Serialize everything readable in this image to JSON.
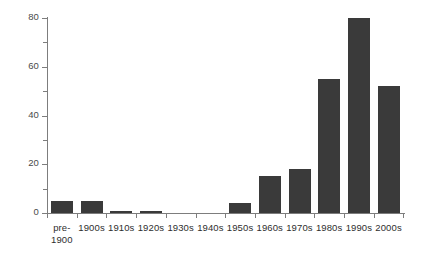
{
  "chart_data": {
    "type": "bar",
    "title": "",
    "subtitle": "",
    "xlabel": "",
    "ylabel": "",
    "categories": [
      "pre-\n1900",
      "1900s",
      "1910s",
      "1920s",
      "1930s",
      "1940s",
      "1950s",
      "1960s",
      "1970s",
      "1980s",
      "1990s",
      "2000s"
    ],
    "values": [
      5,
      5,
      1,
      1,
      0,
      0,
      4,
      15,
      18,
      55,
      80,
      52
    ],
    "ylim": [
      0,
      80
    ],
    "xlim": [
      0,
      12
    ],
    "y_major_ticks": [
      0,
      20,
      40,
      60,
      80
    ],
    "y_minor_ticks": [
      10,
      30,
      50,
      70
    ],
    "y_tick_labels": [
      "0",
      "20",
      "40",
      "60",
      "80"
    ],
    "grid": false,
    "legend": null,
    "legend_position": "none",
    "series": [
      {
        "name": "count",
        "values": [
          5,
          5,
          1,
          1,
          0,
          0,
          4,
          15,
          18,
          55,
          80,
          52
        ]
      }
    ],
    "colors": {
      "bar": "#3a3a3a",
      "axis": "#7d7d7d",
      "text": "#2e2e2e",
      "tick_label": "#4a4a4a",
      "background": "#ffffff"
    }
  }
}
